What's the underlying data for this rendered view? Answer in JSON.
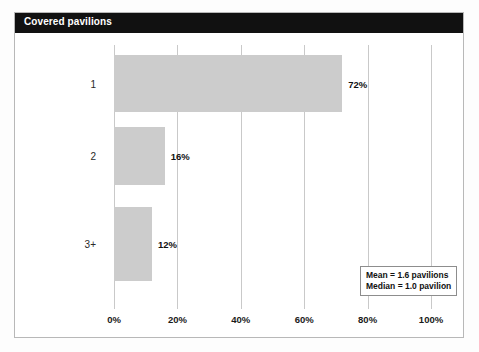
{
  "header": {
    "title": "Covered pavilions",
    "bar_color": "#111111",
    "text_color": "#ffffff"
  },
  "chart_data": {
    "type": "bar",
    "orientation": "horizontal",
    "title": "Covered pavilions",
    "xlabel": "",
    "ylabel": "",
    "categories": [
      "1",
      "2",
      "3+"
    ],
    "values": [
      72,
      16,
      12
    ],
    "value_labels": [
      "72%",
      "16%",
      "12%"
    ],
    "xlim": [
      0,
      100
    ],
    "xticks": [
      0,
      20,
      40,
      60,
      80,
      100
    ],
    "xtick_labels": [
      "0%",
      "20%",
      "40%",
      "60%",
      "80%",
      "100%"
    ],
    "grid": true,
    "grid_axis": "x",
    "legend": "none",
    "bar_color": "#cccccc",
    "annotations": [
      "Mean = 1.6 pavilions",
      "Median = 1.0 pavilion"
    ]
  },
  "stats_box": {
    "mean": "Mean = 1.6 pavilions",
    "median": "Median = 1.0 pavilion"
  }
}
